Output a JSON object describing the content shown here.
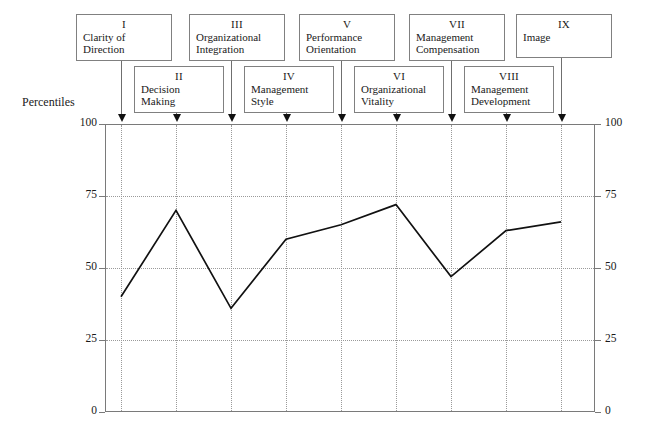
{
  "axis_title": "Percentiles",
  "chart_data": {
    "type": "line",
    "title": "",
    "subtitle": "",
    "xlabel": "",
    "ylabel": "Percentiles",
    "ylim": [
      0,
      100
    ],
    "yticks": [
      "0",
      "25",
      "50",
      "75",
      "100"
    ],
    "ytick_values": [
      0,
      25,
      50,
      75,
      100
    ],
    "grid": true,
    "legend": "none",
    "dual_y_axis": true,
    "right_yticks": [
      "0",
      "25",
      "50",
      "75",
      "100"
    ],
    "categories": [
      "I",
      "II",
      "III",
      "IV",
      "V",
      "VI",
      "VII",
      "VIII",
      "IX"
    ],
    "category_labels": [
      "Clarity of Direction",
      "Decision Making",
      "Organizational Integration",
      "Management Style",
      "Performance Orientation",
      "Organizational Vitality",
      "Management Compensation",
      "Management Development",
      "Image"
    ],
    "values": [
      40,
      70,
      36,
      60,
      65,
      72,
      47,
      63,
      66
    ],
    "series": [
      {
        "name": "Percentile score",
        "values": [
          40,
          70,
          36,
          60,
          65,
          72,
          47,
          63,
          66
        ]
      }
    ]
  },
  "callouts": [
    {
      "roman": "I",
      "name": "Clarity of\nDirection",
      "row": "top"
    },
    {
      "roman": "II",
      "name": "Decision\nMaking",
      "row": "bottom"
    },
    {
      "roman": "III",
      "name": "Organizational\nIntegration",
      "row": "top"
    },
    {
      "roman": "IV",
      "name": "Management\nStyle",
      "row": "bottom"
    },
    {
      "roman": "V",
      "name": "Performance\nOrientation",
      "row": "top"
    },
    {
      "roman": "VI",
      "name": "Organizational\nVitality",
      "row": "bottom"
    },
    {
      "roman": "VII",
      "name": "Management\nCompensation",
      "row": "top"
    },
    {
      "roman": "VIII",
      "name": "Management\nDevelopment",
      "row": "bottom"
    },
    {
      "roman": "IX",
      "name": "Image",
      "row": "top"
    }
  ],
  "colors": {
    "series_line": "#111111",
    "frame": "#7a7a7a",
    "grid": "#9a9a9a",
    "callout_border": "#808080",
    "text": "#1a1a1a",
    "background": "#ffffff"
  }
}
